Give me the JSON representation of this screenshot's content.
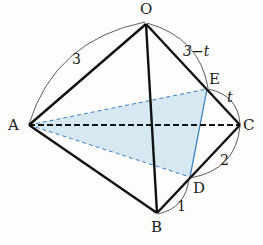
{
  "diagram": {
    "type": "tetrahedron",
    "vertices": {
      "O": {
        "label": "O",
        "x": 146,
        "y": 24
      },
      "A": {
        "label": "A",
        "x": 29,
        "y": 125
      },
      "B": {
        "label": "B",
        "x": 157,
        "y": 213
      },
      "C": {
        "label": "C",
        "x": 240,
        "y": 125
      },
      "E": {
        "label": "E",
        "x": 207,
        "y": 89
      },
      "D": {
        "label": "D",
        "x": 190,
        "y": 177
      }
    },
    "edge_labels": {
      "OA": "3",
      "OE": "3−t",
      "EC": "t",
      "CD": "2",
      "DB": "1"
    },
    "shaded_triangle": [
      "A",
      "E",
      "D"
    ],
    "colors": {
      "edge": "#111111",
      "shade_fill": "#cfe4ef",
      "shade_edge": "#3b7fc4",
      "arc": "#333333"
    }
  }
}
